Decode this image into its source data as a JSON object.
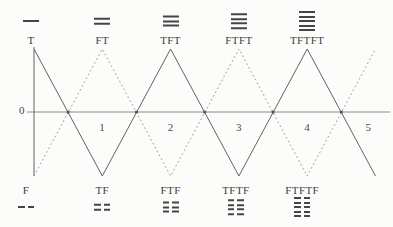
{
  "figure": {
    "axis": {
      "origin": "0",
      "ticks": [
        "1",
        "2",
        "3",
        "4",
        "5"
      ]
    },
    "top_row": [
      {
        "label": "T",
        "lines": 1,
        "line_style": "solid"
      },
      {
        "label": "FT",
        "lines": 2,
        "line_style": "solid"
      },
      {
        "label": "TFT",
        "lines": 3,
        "line_style": "solid"
      },
      {
        "label": "FTFT",
        "lines": 4,
        "line_style": "solid"
      },
      {
        "label": "TFTFT",
        "lines": 5,
        "line_style": "solid"
      }
    ],
    "bottom_row": [
      {
        "label": "F",
        "lines": 1,
        "line_style": "broken"
      },
      {
        "label": "TF",
        "lines": 2,
        "line_style": "broken"
      },
      {
        "label": "FTF",
        "lines": 3,
        "line_style": "broken"
      },
      {
        "label": "TFTF",
        "lines": 4,
        "line_style": "broken"
      },
      {
        "label": "FTFTF",
        "lines": 5,
        "line_style": "broken"
      }
    ],
    "colors": {
      "solid_wave": "#626262",
      "dotted_wave": "#9b9b9b",
      "axis": "#8a8a8a",
      "crossing_dot": "#555555",
      "ink": "#3e3e3e"
    }
  },
  "chart_data": {
    "type": "line",
    "title": "",
    "xlabel": "",
    "ylabel": "",
    "x": [
      0,
      1,
      2,
      3,
      4,
      5
    ],
    "x_tick_labels": [
      "1",
      "2",
      "3",
      "4",
      "5"
    ],
    "ylim": [
      -1,
      1
    ],
    "grid": false,
    "series": [
      {
        "name": "T-sequence",
        "style": "solid",
        "y": [
          1,
          -1,
          1,
          -1,
          1,
          -1
        ],
        "point_labels": [
          "T",
          "TF",
          "TFT",
          "TFTF",
          "TFTFT",
          ""
        ]
      },
      {
        "name": "F-sequence",
        "style": "dotted",
        "y": [
          -1,
          1,
          -1,
          1,
          -1,
          1
        ],
        "point_labels": [
          "F",
          "FT",
          "FTF",
          "FTFT",
          "FTFTF",
          ""
        ]
      }
    ],
    "crossings_x": [
      0.5,
      1.5,
      2.5,
      3.5,
      4.5
    ]
  }
}
